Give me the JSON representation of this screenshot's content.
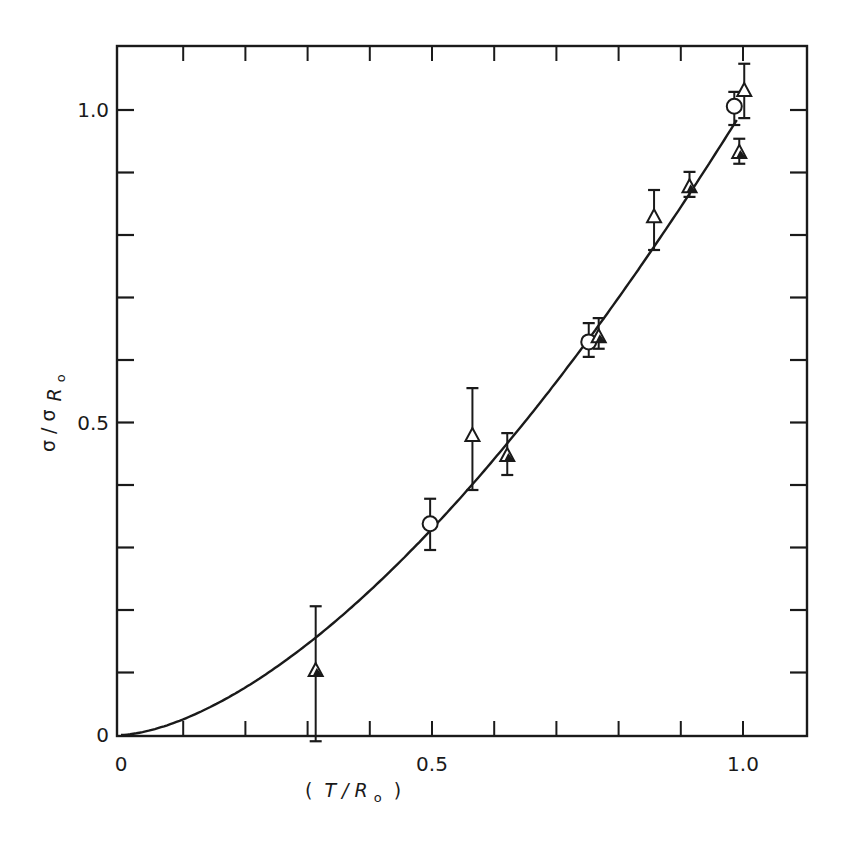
{
  "chart_data": {
    "type": "scatter",
    "title": "",
    "xlabel": "(T / R₀)",
    "ylabel": "σ / σ R₀",
    "xlabel_parts": {
      "open": "(",
      "main": "T / R",
      "sub": "o",
      "close": ")"
    },
    "ylabel_parts": {
      "main": "σ / σ",
      "sub_main": "R",
      "sub_sub": "o"
    },
    "xlim": [
      0,
      1.1
    ],
    "ylim": [
      0,
      1.1
    ],
    "grid": false,
    "legend": null,
    "x_ticks": [
      0,
      0.1,
      0.2,
      0.3,
      0.4,
      0.5,
      0.6,
      0.7,
      0.8,
      0.9,
      1.0
    ],
    "x_tick_labels": [
      {
        "value": 0,
        "label": "0"
      },
      {
        "value": 0.5,
        "label": "0.5"
      },
      {
        "value": 1.0,
        "label": "1.0"
      }
    ],
    "y_ticks": [
      0,
      0.1,
      0.2,
      0.3,
      0.4,
      0.5,
      0.6,
      0.7,
      0.8,
      0.9,
      1.0
    ],
    "y_tick_labels": [
      {
        "value": 0,
        "label": "0"
      },
      {
        "value": 0.5,
        "label": "0.5"
      },
      {
        "value": 1.0,
        "label": "1.0"
      }
    ],
    "series": [
      {
        "name": "open circles",
        "marker": "circle-open",
        "points": [
          {
            "x": 0.497,
            "y": 0.338,
            "ylo": 0.296,
            "yhi": 0.378
          },
          {
            "x": 0.752,
            "y": 0.629,
            "ylo": 0.605,
            "yhi": 0.659
          },
          {
            "x": 0.986,
            "y": 1.006,
            "ylo": 0.976,
            "yhi": 1.029
          }
        ]
      },
      {
        "name": "open triangles",
        "marker": "triangle-open",
        "points": [
          {
            "x": 0.565,
            "y": 0.48,
            "ylo": 0.392,
            "yhi": 0.555
          },
          {
            "x": 0.857,
            "y": 0.83,
            "ylo": 0.776,
            "yhi": 0.872
          },
          {
            "x": 1.002,
            "y": 1.032,
            "ylo": 0.987,
            "yhi": 1.074
          }
        ]
      },
      {
        "name": "filled triangles",
        "marker": "triangle-filled",
        "points": [
          {
            "x": 0.313,
            "y": 0.104,
            "ylo": -0.01,
            "yhi": 0.206
          },
          {
            "x": 0.621,
            "y": 0.448,
            "ylo": 0.416,
            "yhi": 0.483
          },
          {
            "x": 0.768,
            "y": 0.638,
            "ylo": 0.618,
            "yhi": 0.667
          },
          {
            "x": 0.914,
            "y": 0.878,
            "ylo": 0.861,
            "yhi": 0.901
          },
          {
            "x": 0.994,
            "y": 0.933,
            "ylo": 0.914,
            "yhi": 0.954
          }
        ]
      }
    ],
    "fit_curve": {
      "description": "smooth theoretical curve, approx y = x^1.6",
      "exponent": 1.6,
      "x_range": [
        0,
        0.99
      ]
    }
  },
  "layout": {
    "plot_left_px": 117,
    "plot_top_px": 46,
    "plot_right_px": 807,
    "plot_bottom_px": 736,
    "x0_px": 121,
    "x_px_per_unit": 622,
    "y0_px": 735,
    "y_px_per_unit": 625,
    "ink_color": "#1a1a1a"
  }
}
